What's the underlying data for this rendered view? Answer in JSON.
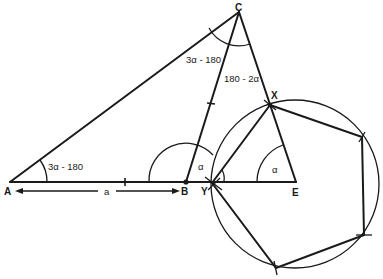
{
  "diagram": {
    "points": {
      "A": "A",
      "B": "B",
      "C": "C",
      "X": "X",
      "Y": "Y",
      "E": "E"
    },
    "angle_labels": {
      "at_A": "3α - 180",
      "at_C_left": "3α - 180",
      "at_C_right": "180 - 2α",
      "at_B": "α",
      "at_E": "α"
    },
    "dimension": {
      "label": "a",
      "from": "A",
      "to": "B"
    },
    "shapes": {
      "triangle": [
        "A",
        "B",
        "C"
      ],
      "cevian": [
        "B",
        "C"
      ],
      "isosceles_triangle": [
        "X",
        "Y",
        "E"
      ],
      "regular_pentagon_with_side": [
        "X",
        "Y"
      ],
      "circumscribed_circle": "pentagon circumcircle"
    }
  }
}
